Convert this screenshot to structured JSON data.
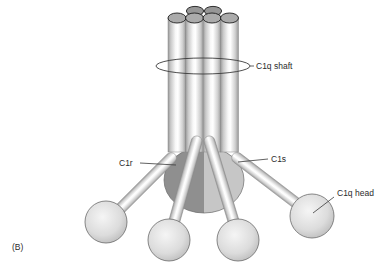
{
  "figure": {
    "panel_label": "(B)",
    "labels": {
      "c1q_shaft": "C1q shaft",
      "c1r": "C1r",
      "c1s": "C1s",
      "c1q_head": "C1q head"
    },
    "colors": {
      "background": "#ffffff",
      "outline_line": "#3a3a3a",
      "text": "#2b2b2b",
      "cylinder_top_front": "#ababab",
      "cylinder_top_back": "#979797",
      "c1r_region_dark": "#8f8f8f",
      "c1s_region_light": "#c6c6c6",
      "sphere_mid": "#d9d9d9"
    }
  }
}
